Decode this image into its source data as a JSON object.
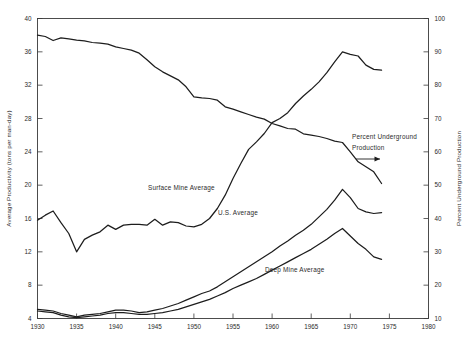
{
  "chart_data": {
    "type": "line",
    "title": "",
    "xlabel": "",
    "ylabel": "Average Productivity (tons per man-day)",
    "y2label": "Percent Underground Production",
    "xlim": [
      1930,
      1980
    ],
    "ylim": [
      4,
      40
    ],
    "y2lim": [
      10,
      100
    ],
    "grid": false,
    "legend": "inline-labels",
    "xticks": [
      "1930",
      "1935",
      "1940",
      "1945",
      "1950",
      "1955",
      "1960",
      "1965",
      "1970",
      "1975",
      "1980"
    ],
    "yticks": [
      "4",
      "8",
      "12",
      "16",
      "20",
      "24",
      "28",
      "32",
      "36",
      "40"
    ],
    "y2ticks": [
      "10",
      "20",
      "30",
      "40",
      "50",
      "60",
      "70",
      "80",
      "90",
      "100"
    ],
    "annotations": [
      {
        "name": "percent-underground-annotation",
        "text_line1": "Percent Underground",
        "text_line2": "Production",
        "arrow": "right"
      }
    ],
    "series": [
      {
        "name": "Percent Underground Production",
        "axis": "right",
        "label_position": "annotation",
        "x": [
          1930,
          1931,
          1932,
          1933,
          1934,
          1935,
          1936,
          1937,
          1938,
          1939,
          1940,
          1941,
          1942,
          1943,
          1944,
          1945,
          1946,
          1947,
          1948,
          1949,
          1950,
          1951,
          1952,
          1953,
          1954,
          1955,
          1956,
          1957,
          1958,
          1959,
          1960,
          1961,
          1962,
          1963,
          1964,
          1965,
          1966,
          1967,
          1968,
          1969,
          1970,
          1971,
          1972,
          1973,
          1974
        ],
        "values": [
          95.0,
          94.6,
          93.4,
          94.2,
          93.9,
          93.5,
          93.3,
          92.8,
          92.6,
          92.3,
          91.5,
          91.0,
          90.5,
          89.6,
          87.6,
          85.5,
          84.0,
          82.8,
          81.6,
          79.5,
          76.5,
          76.2,
          76.0,
          75.5,
          73.5,
          72.8,
          72.0,
          71.2,
          70.4,
          69.8,
          68.5,
          67.8,
          67.0,
          66.8,
          65.4,
          65.0,
          64.6,
          64.0,
          63.2,
          62.8,
          60.0,
          57.0,
          55.5,
          54.0,
          50.5
        ]
      },
      {
        "name": "Surface Mine Average",
        "axis": "left",
        "label_position": "above-line",
        "x": [
          1930,
          1931,
          1932,
          1933,
          1934,
          1935,
          1936,
          1937,
          1938,
          1939,
          1940,
          1941,
          1942,
          1943,
          1944,
          1945,
          1946,
          1947,
          1948,
          1949,
          1950,
          1951,
          1952,
          1953,
          1954,
          1955,
          1956,
          1957,
          1958,
          1959,
          1960,
          1961,
          1962,
          1963,
          1964,
          1965,
          1966,
          1967,
          1968,
          1969,
          1970,
          1971,
          1972,
          1973,
          1974
        ],
        "values": [
          15.8,
          16.4,
          16.9,
          15.5,
          14.2,
          12.0,
          13.5,
          14.0,
          14.4,
          15.2,
          14.7,
          15.2,
          15.3,
          15.3,
          15.2,
          15.9,
          15.2,
          15.6,
          15.5,
          15.1,
          15.0,
          15.3,
          16.0,
          17.2,
          18.8,
          20.8,
          22.6,
          24.3,
          25.2,
          26.2,
          27.5,
          28.0,
          28.7,
          29.8,
          30.7,
          31.5,
          32.4,
          33.5,
          34.8,
          36.0,
          35.7,
          35.5,
          34.4,
          33.9,
          33.8
        ]
      },
      {
        "name": "U.S. Average",
        "axis": "left",
        "label_position": "right-of-line",
        "x": [
          1930,
          1931,
          1932,
          1933,
          1934,
          1935,
          1936,
          1937,
          1938,
          1939,
          1940,
          1941,
          1942,
          1943,
          1944,
          1945,
          1946,
          1947,
          1948,
          1949,
          1950,
          1951,
          1952,
          1953,
          1954,
          1955,
          1956,
          1957,
          1958,
          1959,
          1960,
          1961,
          1962,
          1963,
          1964,
          1965,
          1966,
          1967,
          1968,
          1969,
          1970,
          1971,
          1972,
          1973,
          1974
        ],
        "values": [
          5.1,
          5.0,
          4.9,
          4.6,
          4.4,
          4.2,
          4.4,
          4.5,
          4.6,
          4.8,
          5.0,
          5.0,
          4.9,
          4.7,
          4.8,
          5.0,
          5.2,
          5.5,
          5.8,
          6.2,
          6.6,
          7.0,
          7.3,
          7.8,
          8.4,
          9.0,
          9.6,
          10.2,
          10.8,
          11.4,
          12.0,
          12.7,
          13.3,
          14.0,
          14.6,
          15.3,
          16.2,
          17.1,
          18.2,
          19.5,
          18.5,
          17.2,
          16.8,
          16.6,
          16.7
        ]
      },
      {
        "name": "Deep Mine Average",
        "axis": "left",
        "label_position": "below-line",
        "x": [
          1930,
          1931,
          1932,
          1933,
          1934,
          1935,
          1936,
          1937,
          1938,
          1939,
          1940,
          1941,
          1942,
          1943,
          1944,
          1945,
          1946,
          1947,
          1948,
          1949,
          1950,
          1951,
          1952,
          1953,
          1954,
          1955,
          1956,
          1957,
          1958,
          1959,
          1960,
          1961,
          1962,
          1963,
          1964,
          1965,
          1966,
          1967,
          1968,
          1969,
          1970,
          1971,
          1972,
          1973,
          1974
        ],
        "values": [
          4.9,
          4.8,
          4.7,
          4.4,
          4.2,
          4.1,
          4.2,
          4.3,
          4.4,
          4.6,
          4.7,
          4.7,
          4.6,
          4.5,
          4.5,
          4.6,
          4.7,
          4.9,
          5.1,
          5.4,
          5.7,
          6.0,
          6.3,
          6.7,
          7.1,
          7.6,
          8.0,
          8.4,
          8.8,
          9.3,
          9.8,
          10.3,
          10.8,
          11.3,
          11.8,
          12.3,
          12.9,
          13.5,
          14.2,
          14.8,
          13.9,
          13.0,
          12.3,
          11.4,
          11.1
        ]
      }
    ]
  }
}
